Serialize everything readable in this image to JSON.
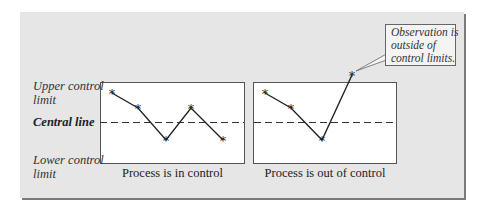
{
  "labels": {
    "upper_line1": "Upper control",
    "upper_line2": "limit",
    "central": "Central line",
    "lower_line1": "Lower control",
    "lower_line2": "limit"
  },
  "captions": {
    "left": "Process is in control",
    "right": "Process is out of control"
  },
  "callout": {
    "line1": "Observation is",
    "line2": "outside of",
    "line3": "control limits."
  },
  "colors": {
    "panel_bg": "#e6e6e6",
    "chart_bg": "#ffffff",
    "line": "#222222",
    "shadow": "#7a7a7a"
  },
  "charts": [
    {
      "title": "Process is in control",
      "points": [
        [
          112,
          93
        ],
        [
          138,
          108
        ],
        [
          166,
          140
        ],
        [
          191,
          108
        ],
        [
          223,
          140
        ]
      ]
    },
    {
      "title": "Process is out of control",
      "points": [
        [
          265,
          93
        ],
        [
          291,
          108
        ],
        [
          322,
          140
        ],
        [
          352,
          75
        ]
      ]
    }
  ]
}
